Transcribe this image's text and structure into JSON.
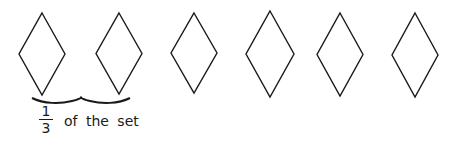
{
  "figure": {
    "shape": "diamond",
    "count": 6,
    "stroke_color": "#1a1a1a",
    "diamonds": [
      {
        "cx": 42,
        "top": 13,
        "bottom": 95,
        "halfw": 23
      },
      {
        "cx": 119,
        "top": 13,
        "bottom": 94,
        "halfw": 23
      },
      {
        "cx": 194,
        "top": 13,
        "bottom": 93,
        "halfw": 23
      },
      {
        "cx": 270,
        "top": 11,
        "bottom": 97,
        "halfw": 24
      },
      {
        "cx": 340,
        "top": 13,
        "bottom": 96,
        "halfw": 23
      },
      {
        "cx": 415,
        "top": 13,
        "bottom": 97,
        "halfw": 23
      }
    ],
    "brace": {
      "spans_diamonds": 2,
      "x_start": 32,
      "x_end": 130
    }
  },
  "label": {
    "numerator": "1",
    "denominator": "3",
    "text": "of the set"
  }
}
